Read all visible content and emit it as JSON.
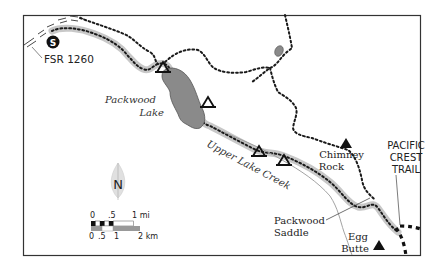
{
  "map": {
    "colors": {
      "frame": "#333333",
      "trail_halo": "#c8c8c8",
      "trail_dots": "#1a1a1a",
      "lake_fill": "#8a8a8a",
      "lake_stroke": "#555555",
      "creek": "#999999",
      "ink": "#111111"
    },
    "start_marker": {
      "letter": "S",
      "road_label": "FSR 1260"
    },
    "labels": {
      "lake": [
        "Packwood",
        "Lake"
      ],
      "creek": "Upper Lake Creek",
      "chimney_rock": [
        "Chimney",
        "Rock"
      ],
      "pct": [
        "PACIFIC",
        "CREST",
        "TRAIL"
      ],
      "saddle": [
        "Packwood",
        "Saddle"
      ],
      "egg_butte": [
        "Egg",
        "Butte"
      ]
    },
    "compass": {
      "letter": "N"
    },
    "scale": {
      "mi_labels": [
        "0",
        ".5",
        "1 mi"
      ],
      "km_labels": [
        "0",
        ".5",
        "1",
        "2 km"
      ]
    },
    "campsites": 4,
    "peaks": [
      "Chimney Rock",
      "Egg Butte"
    ]
  }
}
